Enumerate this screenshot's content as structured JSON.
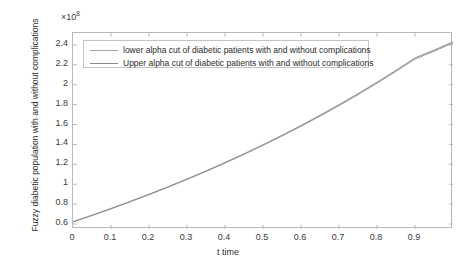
{
  "chart_data": {
    "type": "line",
    "title": "",
    "xlabel": "t time",
    "ylabel": "Fuzzy diabetic population with and without complications",
    "y_exponent_label": "×10",
    "y_exponent_value": "8",
    "xlim": [
      0,
      1.0
    ],
    "ylim": [
      0.55,
      2.52
    ],
    "grid": false,
    "legend_position": "top-left-inside",
    "xticks": [
      "0",
      "0.1",
      "0.2",
      "0.3",
      "0.4",
      "0.5",
      "0.6",
      "0.7",
      "0.8",
      "0.9"
    ],
    "xtick_values": [
      0,
      0.1,
      0.2,
      0.3,
      0.4,
      0.5,
      0.6,
      0.7,
      0.8,
      0.9
    ],
    "yticks": [
      "0.6",
      "0.8",
      "1",
      "1.2",
      "1.4",
      "1.6",
      "1.8",
      "2",
      "2.2",
      "2.4"
    ],
    "ytick_values": [
      0.6,
      0.8,
      1.0,
      1.2,
      1.4,
      1.6,
      1.8,
      2.0,
      2.2,
      2.4
    ],
    "x": [
      0,
      0.05,
      0.1,
      0.15,
      0.2,
      0.25,
      0.3,
      0.35,
      0.4,
      0.45,
      0.5,
      0.55,
      0.6,
      0.65,
      0.7,
      0.75,
      0.8,
      0.85,
      0.9,
      0.95,
      1.0
    ],
    "series": [
      {
        "name": "lower alpha cut of diabetic patients with and without complications",
        "color": "#9a9a9a",
        "values": [
          0.62,
          0.685,
          0.752,
          0.822,
          0.894,
          0.969,
          1.047,
          1.128,
          1.212,
          1.299,
          1.39,
          1.484,
          1.582,
          1.684,
          1.79,
          1.9,
          2.015,
          2.134,
          2.258,
          2.336,
          2.42
        ]
      },
      {
        "name": "Upper alpha cut of diabetic patients with and without complications",
        "color": "#8d8d8d",
        "values": [
          0.624,
          0.689,
          0.757,
          0.827,
          0.9,
          0.975,
          1.053,
          1.134,
          1.219,
          1.306,
          1.397,
          1.492,
          1.59,
          1.693,
          1.799,
          1.91,
          2.025,
          2.145,
          2.27,
          2.348,
          2.43
        ]
      }
    ]
  },
  "legend": {
    "items": [
      {
        "label": "lower alpha cut of diabetic patients with and without complications",
        "color": "#a6a6a6"
      },
      {
        "label": "Upper alpha cut of diabetic patients with and without complications",
        "color": "#8a8a8a"
      }
    ]
  },
  "axes": {
    "x_title": "t time",
    "y_title": "Fuzzy diabetic population with and without complications",
    "exponent": "×10"
  }
}
